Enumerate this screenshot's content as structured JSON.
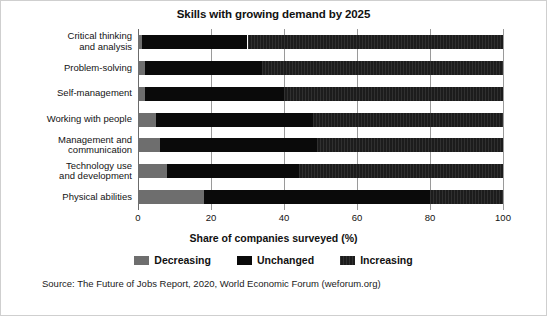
{
  "chart_data": {
    "type": "bar",
    "orientation": "horizontal",
    "stacked": true,
    "title": "Skills with growing demand by 2025",
    "xlabel": "Share of companies surveyed (%)",
    "ylabel": "",
    "xlim": [
      0,
      100
    ],
    "xticks": [
      0,
      20,
      40,
      60,
      80,
      100
    ],
    "grid": true,
    "legend_position": "bottom",
    "categories": [
      "Critical thinking\nand analysis",
      "Problem-solving",
      "Self-management",
      "Working with people",
      "Management and\ncommunication",
      "Technology use\nand development",
      "Physical abilities"
    ],
    "series": [
      {
        "name": "Decreasing",
        "color": "#6e6e6e",
        "values": [
          1,
          2,
          2,
          5,
          6,
          8,
          18
        ]
      },
      {
        "name": "Unchanged",
        "color": "#0a0a0a",
        "values": [
          29,
          32,
          38,
          43,
          43,
          36,
          62
        ]
      },
      {
        "name": "Increasing",
        "color": "#1c1c1c",
        "values": [
          70,
          66,
          60,
          52,
          51,
          56,
          20
        ]
      }
    ],
    "source": "Source: The Future of Jobs Report, 2020, World Economic Forum (weforum.org)"
  },
  "axis": {
    "tick_labels": [
      "0",
      "20",
      "40",
      "60",
      "80",
      "100"
    ]
  },
  "legend": {
    "items": [
      {
        "label": "Decreasing"
      },
      {
        "label": "Unchanged"
      },
      {
        "label": "Increasing"
      }
    ]
  }
}
